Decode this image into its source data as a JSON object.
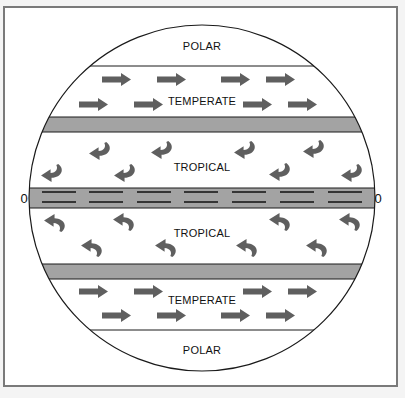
{
  "diagram": {
    "title": "",
    "zones": {
      "north_polar": {
        "label": "POLAR"
      },
      "north_temperate": {
        "label": "TEMPERATE"
      },
      "north_tropical": {
        "label": "TROPICAL"
      },
      "south_tropical": {
        "label": "TROPICAL"
      },
      "south_temperate": {
        "label": "TEMPERATE"
      },
      "south_polar": {
        "label": "POLAR"
      }
    },
    "equator": {
      "left_label": "0",
      "right_label": "0"
    },
    "colors": {
      "band_gray": "#a3a3a3",
      "arrow_gray": "#5f5f5f",
      "line": "#1a1a1a",
      "frame": "#7a7a7a",
      "background": "#ffffff"
    },
    "arrows": {
      "north_temperate": [
        {
          "x": 102,
          "y": 79
        },
        {
          "x": 157,
          "y": 79
        },
        {
          "x": 221,
          "y": 79
        },
        {
          "x": 266,
          "y": 79
        },
        {
          "x": 79,
          "y": 104
        },
        {
          "x": 134,
          "y": 104
        },
        {
          "x": 243,
          "y": 104
        },
        {
          "x": 288,
          "y": 104
        }
      ],
      "south_temperate": [
        {
          "x": 79,
          "y": 291
        },
        {
          "x": 134,
          "y": 291
        },
        {
          "x": 243,
          "y": 291
        },
        {
          "x": 288,
          "y": 291
        },
        {
          "x": 102,
          "y": 315
        },
        {
          "x": 157,
          "y": 315
        },
        {
          "x": 221,
          "y": 315
        },
        {
          "x": 266,
          "y": 315
        }
      ],
      "north_tropical_curved": [
        {
          "x": 88,
          "y": 141
        },
        {
          "x": 150,
          "y": 140
        },
        {
          "x": 233,
          "y": 140
        },
        {
          "x": 302,
          "y": 139
        },
        {
          "x": 40,
          "y": 163
        },
        {
          "x": 113,
          "y": 163
        },
        {
          "x": 268,
          "y": 162
        },
        {
          "x": 340,
          "y": 163
        }
      ],
      "south_tropical_curved": [
        {
          "x": 43,
          "y": 212
        },
        {
          "x": 112,
          "y": 211
        },
        {
          "x": 268,
          "y": 211
        },
        {
          "x": 338,
          "y": 211
        },
        {
          "x": 80,
          "y": 237
        },
        {
          "x": 154,
          "y": 237
        },
        {
          "x": 235,
          "y": 237
        },
        {
          "x": 305,
          "y": 237
        }
      ]
    },
    "equator_dashes": [
      42,
      89,
      137,
      184,
      232,
      280,
      328
    ]
  }
}
